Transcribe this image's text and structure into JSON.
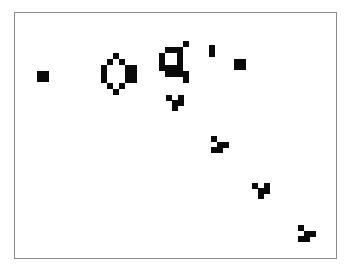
{
  "game": {
    "name": "Game of Life board",
    "cell_size_px": 6,
    "cell_color": "#0a0a0a",
    "border_color": "#8a8a8a",
    "background": "#ffffff",
    "live_cells": [
      [
        37,
        71
      ],
      [
        43,
        71
      ],
      [
        37,
        76
      ],
      [
        43,
        76
      ],
      [
        113,
        53
      ],
      [
        107,
        59
      ],
      [
        119,
        59
      ],
      [
        101,
        65
      ],
      [
        101,
        71
      ],
      [
        101,
        77
      ],
      [
        125,
        65
      ],
      [
        131,
        65
      ],
      [
        125,
        71
      ],
      [
        131,
        71
      ],
      [
        125,
        77
      ],
      [
        131,
        77
      ],
      [
        107,
        83
      ],
      [
        119,
        83
      ],
      [
        113,
        89
      ],
      [
        183,
        41
      ],
      [
        165,
        47
      ],
      [
        171,
        47
      ],
      [
        177,
        47
      ],
      [
        159,
        53
      ],
      [
        177,
        53
      ],
      [
        159,
        59
      ],
      [
        177,
        59
      ],
      [
        159,
        65
      ],
      [
        165,
        65
      ],
      [
        171,
        65
      ],
      [
        177,
        65
      ],
      [
        165,
        71
      ],
      [
        171,
        71
      ],
      [
        177,
        71
      ],
      [
        183,
        71
      ],
      [
        183,
        77
      ],
      [
        209,
        45
      ],
      [
        209,
        51
      ],
      [
        234,
        59
      ],
      [
        240,
        59
      ],
      [
        234,
        64
      ],
      [
        240,
        64
      ],
      [
        166,
        95
      ],
      [
        178,
        95
      ],
      [
        172,
        100
      ],
      [
        178,
        100
      ],
      [
        172,
        105
      ],
      [
        211,
        136
      ],
      [
        217,
        142
      ],
      [
        223,
        142
      ],
      [
        211,
        147
      ],
      [
        217,
        147
      ],
      [
        252,
        183
      ],
      [
        264,
        183
      ],
      [
        258,
        188
      ],
      [
        264,
        188
      ],
      [
        258,
        193
      ],
      [
        298,
        225
      ],
      [
        304,
        231
      ],
      [
        310,
        231
      ],
      [
        298,
        236
      ],
      [
        304,
        236
      ]
    ]
  }
}
